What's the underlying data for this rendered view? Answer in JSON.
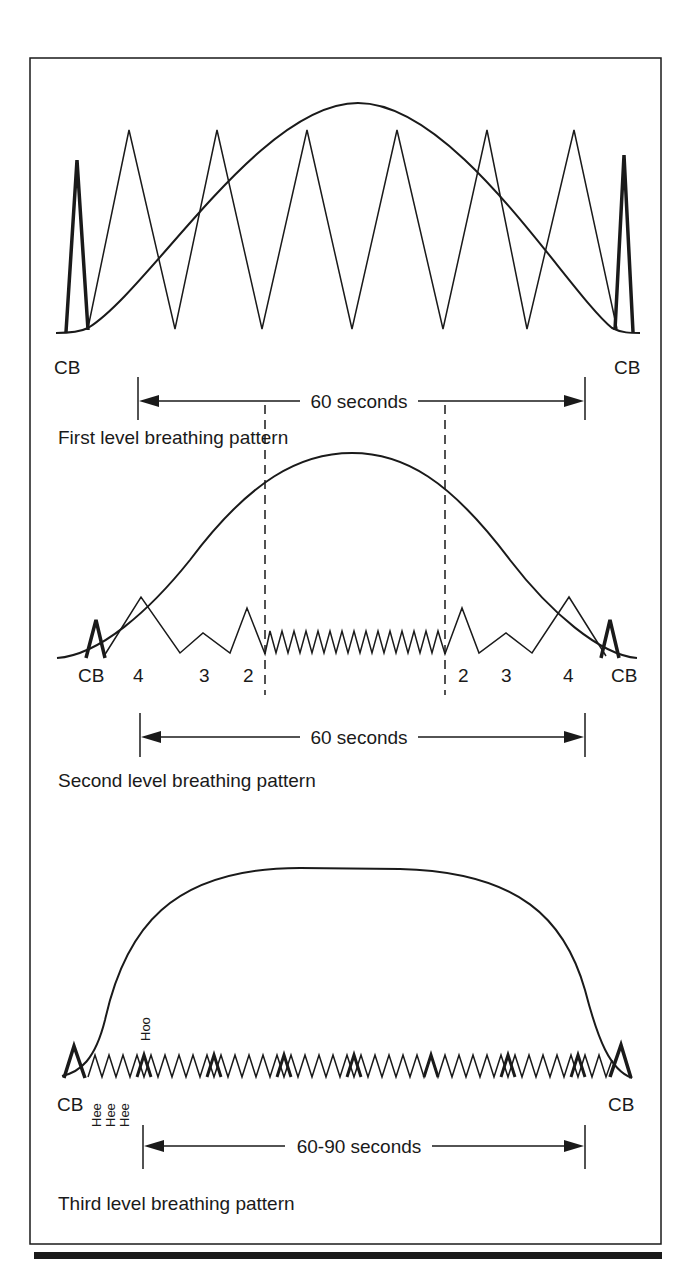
{
  "figure": {
    "panels": [
      {
        "id": "first",
        "caption": "First level breathing pattern",
        "duration_label": "60 seconds",
        "left_label": "CB",
        "right_label": "CB"
      },
      {
        "id": "second",
        "caption": "Second level breathing pattern",
        "duration_label": "60 seconds",
        "labels": [
          "CB",
          "4",
          "3",
          "2",
          "2",
          "3",
          "4",
          "CB"
        ]
      },
      {
        "id": "third",
        "caption": "Third level breathing pattern",
        "duration_label": "60-90 seconds",
        "left_label": "CB",
        "right_label": "CB",
        "hoo_label": "Hoo",
        "hee_labels": [
          "Hee",
          "Hee",
          "Hee"
        ]
      }
    ]
  },
  "colors": {
    "ink": "#1a1a1a",
    "background": "#ffffff"
  }
}
